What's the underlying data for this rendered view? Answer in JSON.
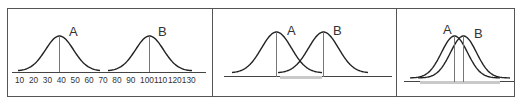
{
  "figure": {
    "panels": [
      {
        "id": "panel-1",
        "labels": {
          "a": "A",
          "b": "B"
        },
        "axis_ticks": [
          "10",
          "20",
          "30",
          "40",
          "50",
          "60",
          "70",
          "80",
          "90",
          "100",
          "110",
          "120",
          "130"
        ],
        "note": "Far apart distributions, no overlap"
      },
      {
        "id": "panel-2",
        "labels": {
          "a": "A",
          "b": "B"
        },
        "note": "Moderately separated, partial overlap shaded"
      },
      {
        "id": "panel-3",
        "labels": {
          "a": "A",
          "b": "B"
        },
        "note": "Nearly identical, large overlap shaded"
      }
    ]
  },
  "chart_data": [
    {
      "type": "line",
      "title": "",
      "xlabel": "",
      "ylabel": "",
      "x_ticks": [
        10,
        20,
        30,
        40,
        50,
        60,
        70,
        80,
        90,
        100,
        110,
        120,
        130
      ],
      "xlim": [
        5,
        135
      ],
      "series": [
        {
          "name": "A",
          "shape": "normal",
          "mean": 38,
          "sd": 9
        },
        {
          "name": "B",
          "shape": "normal",
          "mean": 110,
          "sd": 9
        }
      ],
      "grid": false
    },
    {
      "type": "line",
      "series": [
        {
          "name": "A",
          "shape": "normal",
          "relative_mean": 0,
          "sd": 1
        },
        {
          "name": "B",
          "shape": "normal",
          "relative_mean": 1.6,
          "sd": 1
        }
      ],
      "shaded_overlap": true,
      "grid": false
    },
    {
      "type": "line",
      "series": [
        {
          "name": "A",
          "shape": "normal",
          "relative_mean": 0,
          "sd": 1
        },
        {
          "name": "B",
          "shape": "normal",
          "relative_mean": 0.3,
          "sd": 1
        }
      ],
      "shaded_overlap": true,
      "grid": false
    }
  ],
  "colors": {
    "frame": "#555555",
    "curve": "#222222",
    "mean_line": "#777777",
    "overlap_bar": "#c9c9c9"
  }
}
